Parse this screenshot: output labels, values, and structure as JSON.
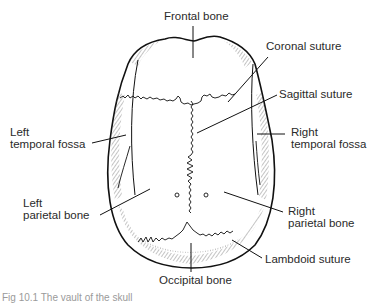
{
  "diagram": {
    "labels": {
      "frontal_bone": "Frontal bone",
      "coronal_suture": "Coronal suture",
      "sagittal_suture": "Sagittal suture",
      "left_temporal_fossa_1": "Left",
      "left_temporal_fossa_2": "temporal fossa",
      "right_temporal_fossa_1": "Right",
      "right_temporal_fossa_2": "temporal fossa",
      "left_parietal_1": "Left",
      "left_parietal_2": "parietal bone",
      "right_parietal_1": "Right",
      "right_parietal_2": "parietal bone",
      "lambdoid_suture": "Lambdoid suture",
      "occipital_bone": "Occipital bone"
    },
    "caption": "Fig 10.1  The vault of the skull"
  },
  "colors": {
    "line": "#1a1a1a",
    "text": "#2a2a2a",
    "background": "#ffffff"
  }
}
